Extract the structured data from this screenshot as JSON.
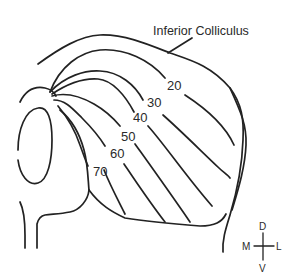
{
  "figure": {
    "title_label": "Inferior Colliculus",
    "contour_labels": [
      "20",
      "30",
      "40",
      "50",
      "60",
      "70"
    ],
    "orientation": {
      "dorsal": "D",
      "ventral": "V",
      "medial": "M",
      "lateral": "L"
    },
    "colors": {
      "line": "#222222",
      "background": "#ffffff"
    }
  }
}
